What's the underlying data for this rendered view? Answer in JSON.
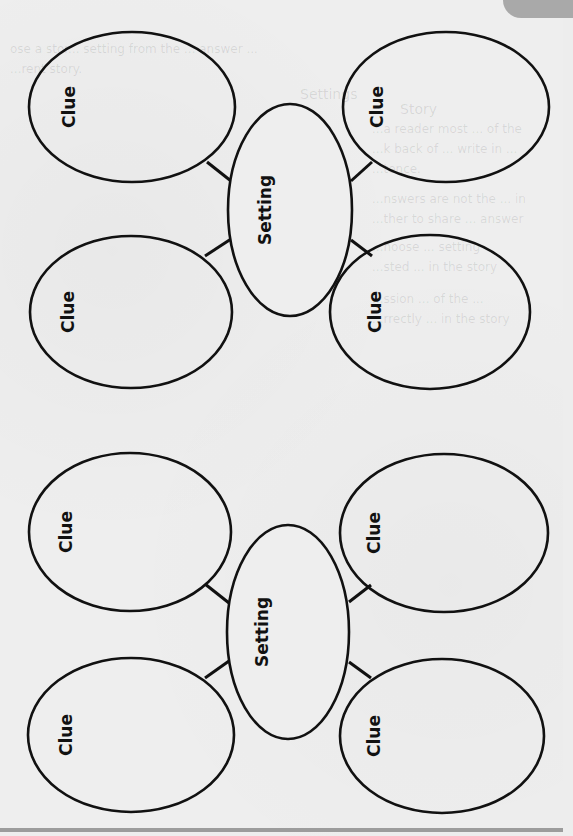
{
  "worksheet": {
    "bleed_through_text": [
      "ose a stor... setting from the ... answer ...",
      "...rent story.",
      "Settings",
      "Story",
      "...a reader most ... of the",
      "...k back of ... write in ...",
      "...tence.",
      "...nswers are not the ... in",
      "...ther to share ... answer",
      "...hoose ... setting",
      "...sted ... in the story",
      "...ssion ... of the ...",
      "...rrectly ... in the story"
    ],
    "colors": {
      "paper": "#eeeeee",
      "ink": "#111111",
      "tab": "#a9a9a9",
      "rule": "#9c9c9c"
    }
  },
  "diagrams": [
    {
      "id": "diagram-1",
      "center": {
        "label": "Setting",
        "cx": 290,
        "cy": 210,
        "rx": 62,
        "ry": 106
      },
      "clues": [
        {
          "label": "Clue",
          "position": "top-left",
          "cx": 132,
          "cy": 107,
          "rx": 103,
          "ry": 75
        },
        {
          "label": "Clue",
          "position": "top-right",
          "cx": 446,
          "cy": 107,
          "rx": 103,
          "ry": 75
        },
        {
          "label": "Clue",
          "position": "bottom-left",
          "cx": 131,
          "cy": 312,
          "rx": 101,
          "ry": 76
        },
        {
          "label": "Clue",
          "position": "bottom-right",
          "cx": 430,
          "cy": 312,
          "rx": 100,
          "ry": 77
        }
      ]
    },
    {
      "id": "diagram-2",
      "center": {
        "label": "Setting",
        "cx": 288,
        "cy": 632,
        "rx": 61,
        "ry": 107
      },
      "clues": [
        {
          "label": "Clue",
          "position": "top-left",
          "cx": 130,
          "cy": 532,
          "rx": 101,
          "ry": 79
        },
        {
          "label": "Clue",
          "position": "top-right",
          "cx": 444,
          "cy": 533,
          "rx": 104,
          "ry": 79
        },
        {
          "label": "Clue",
          "position": "bottom-left",
          "cx": 131,
          "cy": 735,
          "rx": 103,
          "ry": 77
        },
        {
          "label": "Clue",
          "position": "bottom-right",
          "cx": 442,
          "cy": 736,
          "rx": 102,
          "ry": 77
        }
      ]
    }
  ]
}
